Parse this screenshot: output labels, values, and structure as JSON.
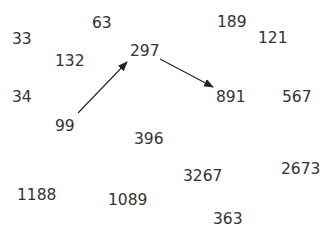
{
  "diagram": {
    "numbers": [
      {
        "id": "n33",
        "label": "33",
        "x": 12,
        "y": 33
      },
      {
        "id": "n63",
        "label": "63",
        "x": 92,
        "y": 17
      },
      {
        "id": "n189",
        "label": "189",
        "x": 217,
        "y": 16
      },
      {
        "id": "n121",
        "label": "121",
        "x": 258,
        "y": 32
      },
      {
        "id": "n132",
        "label": "132",
        "x": 55,
        "y": 55
      },
      {
        "id": "n297",
        "label": "297",
        "x": 130,
        "y": 45
      },
      {
        "id": "n34",
        "label": "34",
        "x": 12,
        "y": 91
      },
      {
        "id": "n891",
        "label": "891",
        "x": 216,
        "y": 91
      },
      {
        "id": "n567",
        "label": "567",
        "x": 282,
        "y": 91
      },
      {
        "id": "n99",
        "label": "99",
        "x": 55,
        "y": 120
      },
      {
        "id": "n396",
        "label": "396",
        "x": 134,
        "y": 133
      },
      {
        "id": "n2673",
        "label": "2673",
        "x": 281,
        "y": 163
      },
      {
        "id": "n3267",
        "label": "3267",
        "x": 183,
        "y": 170
      },
      {
        "id": "n1188",
        "label": "1188",
        "x": 17,
        "y": 189
      },
      {
        "id": "n1089",
        "label": "1089",
        "x": 108,
        "y": 194
      },
      {
        "id": "n363",
        "label": "363",
        "x": 213,
        "y": 213
      }
    ],
    "arrows": [
      {
        "from": "99",
        "to": "297",
        "x1": 78,
        "y1": 113,
        "x2": 127,
        "y2": 62
      },
      {
        "from": "297",
        "to": "891",
        "x1": 160,
        "y1": 59,
        "x2": 213,
        "y2": 87
      }
    ],
    "colors": {
      "text": "#333333",
      "arrow": "#222222",
      "background": "#ffffff"
    }
  }
}
